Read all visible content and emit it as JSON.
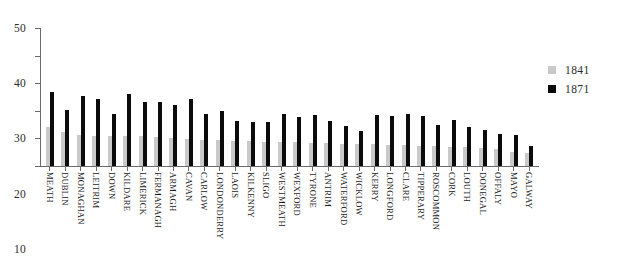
{
  "chart_data": {
    "type": "bar",
    "title": "",
    "subtitle": "",
    "xlabel": "",
    "ylabel": "",
    "ylim": [
      0,
      50
    ],
    "yticks": [
      0,
      10,
      20,
      30,
      40,
      50
    ],
    "grid": false,
    "legend_position": "right",
    "categories": [
      "MEATH",
      "DUBLIN",
      "MONAGHAN",
      "LEITRIM",
      "DOWN",
      "KILDARE",
      "LIMERICK",
      "FERMANAGH",
      "ARMAGH",
      "CAVAN",
      "CARLOW",
      "LONDONDERRY",
      "LAOIS",
      "KILKENNY",
      "SLIGO",
      "WESTMEATH",
      "WEXFORD",
      "TYRONE",
      "ANTRIM",
      "WATERFORD",
      "WICKLOW",
      "KERRY",
      "LONGFORD",
      "CLARE",
      "TIPPERARY",
      "ROSCOMMON",
      "CORK",
      "LOUTH",
      "DONEGAL",
      "OFFALY",
      "MAYO",
      "GALWAY"
    ],
    "series": [
      {
        "name": "1841",
        "color": "#c9c9c9",
        "values": [
          14.0,
          12.3,
          11.3,
          11.0,
          11.0,
          10.8,
          10.7,
          10.5,
          10.3,
          9.9,
          9.6,
          9.4,
          9.2,
          9.0,
          8.8,
          8.7,
          8.6,
          8.3,
          8.2,
          8.0,
          7.9,
          7.8,
          7.7,
          7.6,
          7.4,
          7.2,
          7.0,
          6.8,
          6.4,
          6.0,
          5.2,
          4.6
        ]
      },
      {
        "name": "1871",
        "color": "#0b0b0b",
        "values": [
          26.8,
          20.3,
          25.3,
          24.1,
          18.9,
          26.0,
          23.2,
          23.2,
          22.0,
          24.1,
          18.9,
          19.9,
          16.2,
          16.0,
          16.0,
          18.8,
          17.6,
          18.4,
          16.3,
          14.6,
          12.8,
          18.5,
          18.2,
          18.8,
          18.1,
          15.0,
          16.7,
          14.3,
          12.9,
          11.6,
          11.4,
          7.2
        ]
      }
    ]
  },
  "legend": {
    "entries": [
      {
        "label": "1841",
        "color": "#c9c9c9",
        "swatch_name": "legend-swatch-1841"
      },
      {
        "label": "1871",
        "color": "#0b0b0b",
        "swatch_name": "legend-swatch-1871"
      }
    ]
  }
}
